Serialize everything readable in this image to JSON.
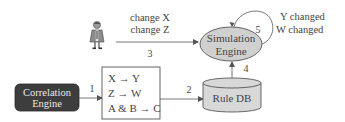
{
  "diagram": {
    "nodes": {
      "user": {
        "label": "",
        "icon": "person-icon"
      },
      "simulation_engine": {
        "line1": "Simulation",
        "line2": "Engine",
        "fill": "#d0d0d0",
        "stroke": "#555555"
      },
      "correlation_engine": {
        "line1": "Correlation",
        "line2": "Engine",
        "fill": "#3d3d3d",
        "text_color": "#e8e8e8"
      },
      "rules_box": {
        "rules": [
          "X → Y",
          "Z → W",
          "A & B → C"
        ],
        "fill": "#ffffff",
        "stroke": "#555555"
      },
      "rule_db": {
        "label": "Rule DB",
        "fill": "#d8d8d8",
        "stroke": "#555555"
      }
    },
    "edges": [
      {
        "id": "1",
        "label": "1",
        "from": "correlation_engine",
        "to": "rules_box"
      },
      {
        "id": "2",
        "label": "2",
        "from": "rules_box",
        "to": "rule_db"
      },
      {
        "id": "3",
        "label": "3",
        "from": "user",
        "to": "simulation_engine",
        "annotation": [
          "change X",
          "change Z"
        ]
      },
      {
        "id": "4",
        "label": "4",
        "from": "rule_db",
        "to": "simulation_engine"
      },
      {
        "id": "5",
        "label": "5",
        "from": "simulation_engine",
        "to": "simulation_engine",
        "annotation": [
          "Y changed",
          "W changed"
        ]
      }
    ],
    "colors": {
      "line": "#555555",
      "text": "#444444"
    }
  }
}
